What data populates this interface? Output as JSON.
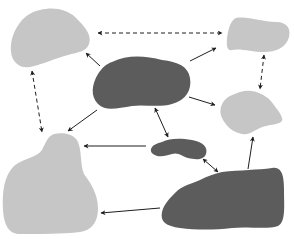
{
  "diagram": {
    "type": "node-relationship",
    "colors": {
      "background": "#ffffff",
      "light_node": "#c6c6c6",
      "dark_node": "#5c5c5c",
      "arrow": "#1e1e1e"
    },
    "nodes": [
      {
        "id": "top-left",
        "shade": "light"
      },
      {
        "id": "top-right",
        "shade": "light"
      },
      {
        "id": "mid-right",
        "shade": "light"
      },
      {
        "id": "bottom-left",
        "shade": "light"
      },
      {
        "id": "center",
        "shade": "dark"
      },
      {
        "id": "small-center",
        "shade": "dark"
      },
      {
        "id": "bottom-right",
        "shade": "dark"
      }
    ],
    "edges": [
      {
        "from": "top-left",
        "to": "top-right",
        "style": "dashed",
        "direction": "both"
      },
      {
        "from": "top-right",
        "to": "mid-right",
        "style": "dashed",
        "direction": "both"
      },
      {
        "from": "top-left",
        "to": "bottom-left",
        "style": "dashed",
        "direction": "both"
      },
      {
        "from": "center",
        "to": "top-left",
        "style": "solid",
        "direction": "forward"
      },
      {
        "from": "center",
        "to": "top-right",
        "style": "solid",
        "direction": "forward"
      },
      {
        "from": "center",
        "to": "mid-right",
        "style": "solid",
        "direction": "forward"
      },
      {
        "from": "center",
        "to": "bottom-left",
        "style": "solid",
        "direction": "forward"
      },
      {
        "from": "center",
        "to": "small-center",
        "style": "solid",
        "direction": "both"
      },
      {
        "from": "small-center",
        "to": "bottom-left",
        "style": "solid",
        "direction": "forward"
      },
      {
        "from": "small-center",
        "to": "bottom-right",
        "style": "solid",
        "direction": "both"
      },
      {
        "from": "bottom-right",
        "to": "mid-right",
        "style": "solid",
        "direction": "forward"
      },
      {
        "from": "bottom-right",
        "to": "bottom-left",
        "style": "solid",
        "direction": "forward"
      }
    ]
  }
}
